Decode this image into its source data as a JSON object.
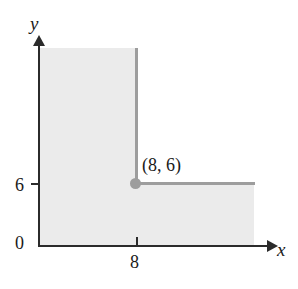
{
  "figure": {
    "background_color": "#ffffff",
    "shade_color": "#ebebeb",
    "boundary_color": "#9d9d9d",
    "axis_color": "#2b2b2b"
  },
  "axes": {
    "x_label": "x",
    "y_label": "y",
    "origin_label": "0"
  },
  "ticks": {
    "y": [
      {
        "value": 6,
        "label": "6"
      }
    ],
    "x": [
      {
        "value": 8,
        "label": "8"
      }
    ]
  },
  "annotations": {
    "corner_point_label": "(8, 6)"
  },
  "chart_data": {
    "type": "area",
    "title": "",
    "xlabel": "x",
    "ylabel": "y",
    "grid": false,
    "legend": "none",
    "xlim": [
      0,
      19
    ],
    "ylim": [
      0,
      13
    ],
    "xticks": [
      8
    ],
    "xticklabels": [
      "8"
    ],
    "yticks": [
      6
    ],
    "yticklabels": [
      "6"
    ],
    "origin_label": "0",
    "series": [
      {
        "name": "shaded-region-boundary",
        "kind": "step-boundary",
        "color": "#9d9d9d",
        "points": [
          {
            "x": 8,
            "y": 13
          },
          {
            "x": 8,
            "y": 6
          },
          {
            "x": 18,
            "y": 6
          }
        ]
      }
    ],
    "shaded_regions": [
      {
        "name": "upper-block",
        "x_range": [
          0,
          8
        ],
        "y_range": [
          6,
          13
        ],
        "color": "#ebebeb"
      },
      {
        "name": "lower-block",
        "x_range": [
          0,
          18
        ],
        "y_range": [
          0,
          6
        ],
        "color": "#ebebeb"
      }
    ],
    "annotations": [
      {
        "text": "(8, 6)",
        "x": 8,
        "y": 6
      }
    ],
    "markers": [
      {
        "x": 8,
        "y": 6,
        "label": "(8, 6)",
        "color": "#9d9d9d"
      }
    ]
  }
}
